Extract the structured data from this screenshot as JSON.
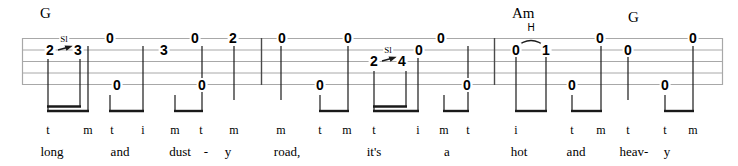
{
  "sheet": {
    "type": "banjo-tablature",
    "strings": 5,
    "staff": {
      "left": 22,
      "right": 723,
      "top": 38,
      "line_spacing": 11.5,
      "line_color": "#a8a8a8",
      "barline_color": "#3a3a3a"
    },
    "measures": [
      {
        "index": 1,
        "start_x": 22,
        "end_x": 261,
        "chord": {
          "label": "G",
          "x": 44,
          "y": 8
        }
      },
      {
        "index": 2,
        "start_x": 261,
        "end_x": 494,
        "chord": null
      },
      {
        "index": 3,
        "start_x": 494,
        "end_x": 723,
        "chord": {
          "label": "Am",
          "x": 523,
          "y": 8
        },
        "chord2": {
          "label": "G",
          "x": 632,
          "y": 12
        }
      }
    ],
    "barlines": [
      261,
      494
    ],
    "notes": [
      {
        "id": "n1",
        "fret": "2",
        "string": 2,
        "x": 50,
        "measure": 1
      },
      {
        "id": "n2",
        "fret": "3",
        "string": 2,
        "x": 78,
        "measure": 1
      },
      {
        "id": "n3",
        "fret": "0",
        "string": 1,
        "x": 110,
        "measure": 1
      },
      {
        "id": "n4",
        "fret": "0",
        "string": 5,
        "x": 117,
        "measure": 1
      },
      {
        "id": "n5",
        "fret": "3",
        "string": 2,
        "x": 164,
        "measure": 1
      },
      {
        "id": "n6",
        "fret": "0",
        "string": 1,
        "x": 195,
        "measure": 1
      },
      {
        "id": "n7",
        "fret": "0",
        "string": 5,
        "x": 202,
        "measure": 1
      },
      {
        "id": "n8",
        "fret": "2",
        "string": 1,
        "x": 233,
        "measure": 1
      },
      {
        "id": "n9",
        "fret": "0",
        "string": 1,
        "x": 282,
        "measure": 2
      },
      {
        "id": "n10",
        "fret": "0",
        "string": 5,
        "x": 320,
        "measure": 2
      },
      {
        "id": "n11",
        "fret": "0",
        "string": 1,
        "x": 348,
        "measure": 2
      },
      {
        "id": "n12",
        "fret": "2",
        "string": 2,
        "x": 374,
        "measure": 2
      },
      {
        "id": "n13",
        "fret": "4",
        "string": 2,
        "x": 402,
        "measure": 2
      },
      {
        "id": "n14",
        "fret": "0",
        "string": 2,
        "x": 417,
        "measure": 2
      },
      {
        "id": "n15",
        "fret": "0",
        "string": 1,
        "x": 441,
        "measure": 2
      },
      {
        "id": "n16",
        "fret": "0",
        "string": 5,
        "x": 467,
        "measure": 2
      },
      {
        "id": "n17",
        "fret": "0",
        "string": 2,
        "x": 516,
        "measure": 3
      },
      {
        "id": "n18",
        "fret": "1",
        "string": 2,
        "x": 546,
        "measure": 3
      },
      {
        "id": "n19",
        "fret": "0",
        "string": 5,
        "x": 572,
        "measure": 3
      },
      {
        "id": "n20",
        "fret": "0",
        "string": 1,
        "x": 600,
        "measure": 3
      },
      {
        "id": "n21",
        "fret": "0",
        "string": 2,
        "x": 628,
        "measure": 3
      },
      {
        "id": "n22",
        "fret": "0",
        "string": 5,
        "x": 665,
        "measure": 3
      },
      {
        "id": "n23",
        "fret": "0",
        "string": 1,
        "x": 693,
        "measure": 3
      }
    ],
    "techniques": [
      {
        "id": "sl1",
        "kind": "slide",
        "label": "Sl",
        "x": 64,
        "y": 39,
        "from": "2",
        "to": "3",
        "arrow_x1": 58,
        "arrow_x2": 71,
        "arrow_y": 48
      },
      {
        "id": "sl2",
        "kind": "slide",
        "label": "Sl",
        "x": 388,
        "y": 50,
        "from": "2",
        "to": "4",
        "arrow_x1": 382,
        "arrow_x2": 395,
        "arrow_y": 59
      },
      {
        "id": "h1",
        "kind": "hammer-on",
        "label": "H",
        "x": 531,
        "y": 32,
        "from": "0",
        "to": "1",
        "slur_x1": 516,
        "slur_x2": 546,
        "slur_y": 42
      }
    ],
    "fingering": [
      {
        "letter": "t",
        "x": 48,
        "measure": 1
      },
      {
        "letter": "m",
        "x": 88,
        "measure": 1
      },
      {
        "letter": "t",
        "x": 112,
        "measure": 1
      },
      {
        "letter": "i",
        "x": 143,
        "measure": 1
      },
      {
        "letter": "m",
        "x": 175,
        "measure": 1
      },
      {
        "letter": "t",
        "x": 201,
        "measure": 1
      },
      {
        "letter": "m",
        "x": 234,
        "measure": 1
      },
      {
        "letter": "m",
        "x": 281,
        "measure": 2
      },
      {
        "letter": "t",
        "x": 320,
        "measure": 2
      },
      {
        "letter": "m",
        "x": 347,
        "measure": 2
      },
      {
        "letter": "t",
        "x": 374,
        "measure": 2
      },
      {
        "letter": "i",
        "x": 418,
        "measure": 2
      },
      {
        "letter": "m",
        "x": 444,
        "measure": 2
      },
      {
        "letter": "t",
        "x": 468,
        "measure": 2
      },
      {
        "letter": "i",
        "x": 516,
        "measure": 3
      },
      {
        "letter": "t",
        "x": 572,
        "measure": 3
      },
      {
        "letter": "m",
        "x": 601,
        "measure": 3
      },
      {
        "letter": "t",
        "x": 628,
        "measure": 3
      },
      {
        "letter": "t",
        "x": 665,
        "measure": 3
      },
      {
        "letter": "m",
        "x": 693,
        "measure": 3
      }
    ],
    "lyrics": [
      {
        "text": "long",
        "x": 52,
        "measure": 1
      },
      {
        "text": "and",
        "x": 120,
        "measure": 1
      },
      {
        "text": "dust",
        "x": 180,
        "measure": 1
      },
      {
        "text": "-",
        "x": 206,
        "measure": 1
      },
      {
        "text": "y",
        "x": 228,
        "measure": 1
      },
      {
        "text": "road,",
        "x": 287,
        "measure": 2
      },
      {
        "text": "it's",
        "x": 374,
        "measure": 2
      },
      {
        "text": "a",
        "x": 447,
        "measure": 2
      },
      {
        "text": "hot",
        "x": 519,
        "measure": 3
      },
      {
        "text": "and",
        "x": 576,
        "measure": 3
      },
      {
        "text": "heav-",
        "x": 634,
        "measure": 3
      },
      {
        "text": "y",
        "x": 667,
        "measure": 3
      }
    ],
    "beam_groups": [
      {
        "id": "b1",
        "x1": 48,
        "x2": 80,
        "y": 107,
        "type": "sixteenth",
        "stem_top": 60
      },
      {
        "id": "b1b",
        "x1": 48,
        "x2": 88,
        "y": 111,
        "type": "eighth",
        "stem_top": 60
      },
      {
        "id": "b2",
        "x1": 110,
        "x2": 143,
        "y": 111,
        "type": "eighth",
        "stem_top": 95
      },
      {
        "id": "b3",
        "x1": 175,
        "x2": 202,
        "y": 111,
        "type": "eighth",
        "stem_top": 95
      },
      {
        "id": "b4",
        "x1": 320,
        "x2": 348,
        "y": 111,
        "type": "eighth",
        "stem_top": 95
      },
      {
        "id": "b5",
        "x1": 374,
        "x2": 406,
        "y": 107,
        "type": "sixteenth",
        "stem_top": 72
      },
      {
        "id": "b6",
        "x1": 374,
        "x2": 418,
        "y": 111,
        "type": "eighth",
        "stem_top": 72
      },
      {
        "id": "b7",
        "x1": 444,
        "x2": 468,
        "y": 111,
        "type": "eighth",
        "stem_top": 95
      },
      {
        "id": "b8",
        "x1": 516,
        "x2": 546,
        "y": 111,
        "type": "eighth",
        "stem_top": 56
      },
      {
        "id": "b9",
        "x1": 572,
        "x2": 601,
        "y": 111,
        "type": "eighth",
        "stem_top": 95
      },
      {
        "id": "b10",
        "x1": 665,
        "x2": 693,
        "y": 111,
        "type": "eighth",
        "stem_top": 95
      }
    ]
  }
}
